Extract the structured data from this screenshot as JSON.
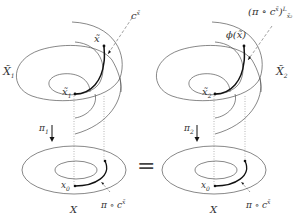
{
  "figure": {
    "left_panel": {
      "covering_space_label": "X̃",
      "covering_space_sub": "1",
      "lift_endpoint_label": "x̃",
      "basepoint_label": "x̃",
      "basepoint_sub": "1",
      "path_label": "c",
      "path_sup": "x̃",
      "projection_label": "π",
      "projection_sub": "1",
      "base_space_label": "X",
      "base_point_label": "x",
      "base_point_sub": "0",
      "base_path_label": "π ∘ c",
      "base_path_sup": "x̃"
    },
    "equals_sign": "=",
    "right_panel": {
      "covering_space_label": "X̃",
      "covering_space_sub": "2",
      "lift_endpoint_label": "ϕ(x̃)",
      "basepoint_label": "x̃",
      "basepoint_sub": "2",
      "path_label": "(π ∘ c",
      "path_sup_inner": "x̃",
      "path_close": ")",
      "path_sup": "L",
      "path_sub": "x̃₂",
      "projection_label": "π",
      "projection_sub": "2",
      "base_space_label": "X",
      "base_point_label": "x",
      "base_point_sub": "0",
      "base_path_label": "π ∘ c",
      "base_path_sup": "x̃"
    },
    "colors": {
      "stroke": "#444444",
      "thick_path": "#111111",
      "dashed": "#777777"
    }
  }
}
